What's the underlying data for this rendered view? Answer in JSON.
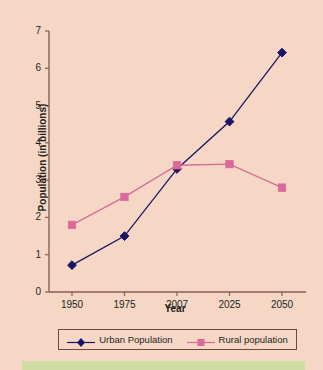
{
  "chart_data": {
    "type": "line",
    "title": "",
    "subtitle": "",
    "xlabel": "Year",
    "ylabel": "Population (in billions)",
    "categories": [
      "1950",
      "1975",
      "2007",
      "2025",
      "2050"
    ],
    "xtick_labels": [
      "1950",
      "1975",
      "2007",
      "2025",
      "2050"
    ],
    "ytick_labels": [
      "0",
      "1",
      "2",
      "3",
      "4",
      "5",
      "6",
      "7"
    ],
    "ylim": [
      0,
      7
    ],
    "yticks": [
      0,
      1,
      2,
      3,
      4,
      5,
      6,
      7
    ],
    "grid": false,
    "legend_position": "bottom",
    "series": [
      {
        "name": "Urban Population",
        "color": "#1b1464",
        "marker": "diamond",
        "values": [
          0.72,
          1.5,
          3.3,
          4.57,
          6.42
        ]
      },
      {
        "name": "Rural population",
        "color": "#d96a9a",
        "marker": "square",
        "values": [
          1.8,
          2.55,
          3.4,
          3.43,
          2.8
        ]
      }
    ]
  },
  "colors": {
    "background": "#f6d7c6",
    "axis": "#8a5f55",
    "text": "#231f20",
    "urban": "#1b1464",
    "rural": "#d96a9a",
    "legend_border": "#6b4a43",
    "bottom_strip": "#cfdca2"
  },
  "legend": {
    "entries": [
      {
        "label": "Urban Population",
        "marker": "diamond-marker-icon",
        "color": "#1b1464"
      },
      {
        "label": "Rural population",
        "marker": "square-marker-icon",
        "color": "#d96a9a"
      }
    ]
  }
}
